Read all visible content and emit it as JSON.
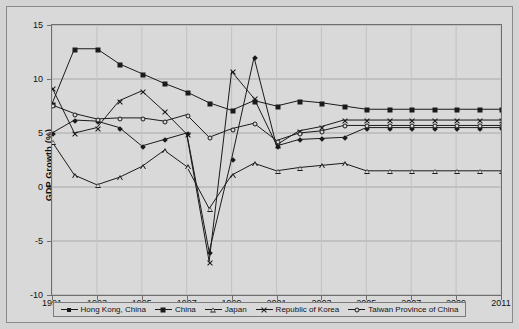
{
  "chart_data": {
    "type": "line",
    "title": "",
    "xlabel": "",
    "ylabel": "GDP Growth (%)",
    "ylim": [
      -10,
      15
    ],
    "xlim": [
      1991,
      2011
    ],
    "grid": true,
    "legend_position": "bottom",
    "ytick_labels": [
      "15",
      "10",
      "5",
      "0",
      "-5",
      "-10"
    ],
    "ytick_values": [
      15,
      10,
      5,
      0,
      -5,
      -10
    ],
    "xtick_labels": [
      "1991",
      "1993",
      "1995",
      "1997",
      "1999",
      "2001",
      "2003",
      "2005",
      "2007",
      "2009",
      "2011"
    ],
    "xtick_values": [
      1991,
      1993,
      1995,
      1997,
      1999,
      2001,
      2003,
      2005,
      2007,
      2009,
      2011
    ],
    "x": [
      1991,
      1992,
      1993,
      1994,
      1995,
      1996,
      1997,
      1998,
      1999,
      2000,
      2001,
      2002,
      2003,
      2004,
      2005,
      2006,
      2007,
      2008,
      2009,
      2010,
      2011
    ],
    "series": [
      {
        "name": "Hong Kong, China",
        "marker": "diamond",
        "values": [
          5.0,
          6.2,
          6.1,
          5.5,
          3.8,
          4.4,
          5.0,
          -6.0,
          2.6,
          12.0,
          3.8,
          4.4,
          4.5,
          4.6,
          5.5,
          5.5,
          5.5,
          5.5,
          5.5,
          5.5,
          5.5
        ]
      },
      {
        "name": "China",
        "marker": "square",
        "values": [
          7.7,
          12.8,
          12.8,
          11.4,
          10.5,
          9.6,
          8.8,
          7.8,
          7.1,
          8.0,
          7.5,
          8.0,
          7.8,
          7.5,
          7.2,
          7.2,
          7.2,
          7.2,
          7.2,
          7.2,
          7.2
        ]
      },
      {
        "name": "Japan",
        "marker": "triangle",
        "values": [
          4.2,
          1.1,
          0.2,
          0.9,
          1.9,
          3.4,
          1.9,
          -2.0,
          1.1,
          2.2,
          1.5,
          1.8,
          2.0,
          2.2,
          1.5,
          1.5,
          1.5,
          1.5,
          1.5,
          1.5,
          1.5
        ]
      },
      {
        "name": "Republic of Korea",
        "marker": "x",
        "values": [
          9.2,
          5.0,
          5.5,
          8.0,
          8.9,
          7.0,
          4.9,
          -6.9,
          10.7,
          8.2,
          3.9,
          5.2,
          5.6,
          6.2,
          6.2,
          6.2,
          6.2,
          6.2,
          6.2,
          6.2,
          6.2
        ]
      },
      {
        "name": "Taiwan Province of China",
        "marker": "circle",
        "values": [
          7.6,
          6.8,
          6.3,
          6.4,
          6.4,
          6.1,
          6.7,
          4.6,
          5.4,
          5.9,
          4.3,
          5.0,
          5.2,
          5.7,
          5.7,
          5.7,
          5.7,
          5.7,
          5.7,
          5.7,
          5.7
        ]
      }
    ]
  },
  "legend": {
    "items": [
      {
        "label": "Hong Kong, China"
      },
      {
        "label": "China"
      },
      {
        "label": "Japan"
      },
      {
        "label": "Republic of Korea"
      },
      {
        "label": "Taiwan Province of China"
      }
    ]
  }
}
